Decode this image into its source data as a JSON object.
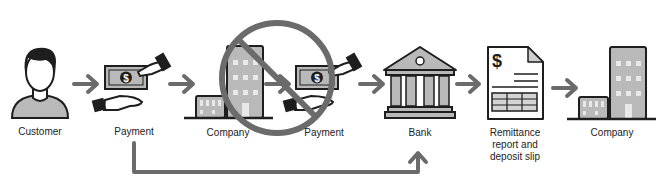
{
  "diagram": {
    "type": "process-flow",
    "colors": {
      "stroke": "#1e1e1e",
      "fill_gray": "#b9b9b9",
      "fill_light": "#d4d4d4",
      "arrow": "#6b6b6b",
      "prohibition": "#6b6b6b",
      "background": "#ffffff"
    },
    "nodes": [
      {
        "id": "customer",
        "label": "Customer",
        "icon": "person-icon"
      },
      {
        "id": "payment1",
        "label": "Payment",
        "icon": "cash-hand-icon"
      },
      {
        "id": "company1",
        "label": "Company",
        "icon": "building-icon",
        "crossed_out": true
      },
      {
        "id": "payment2",
        "label": "Payment",
        "icon": "cash-hand-icon",
        "crossed_out": true
      },
      {
        "id": "bank",
        "label": "Bank",
        "icon": "bank-icon"
      },
      {
        "id": "remittance",
        "label_lines": [
          "Remittance",
          "report and",
          "deposit slip"
        ],
        "icon": "document-icon"
      },
      {
        "id": "company2",
        "label": "Company",
        "icon": "building-icon"
      }
    ],
    "edges": [
      {
        "from": "customer",
        "to": "payment1"
      },
      {
        "from": "payment1",
        "to": "company1"
      },
      {
        "from": "company1",
        "to": "payment2"
      },
      {
        "from": "payment2",
        "to": "bank"
      },
      {
        "from": "bank",
        "to": "remittance"
      },
      {
        "from": "remittance",
        "to": "company2"
      },
      {
        "from": "payment1",
        "to": "bank",
        "style": "bypass-below"
      }
    ],
    "prohibition_symbol": {
      "covers": [
        "company1",
        "payment2"
      ],
      "icon": "prohibited-icon"
    }
  }
}
